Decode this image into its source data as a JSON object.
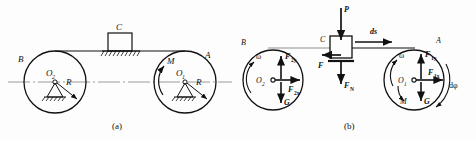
{
  "figure": {
    "caption_a": "(a)",
    "caption_b": "(b)"
  },
  "diagram_a": {
    "name": "mechanism-schematic",
    "pulley_left": {
      "center_label": "O",
      "center_sub": "2",
      "edge_label": "B",
      "radius_label": "R"
    },
    "pulley_right": {
      "center_label": "O",
      "center_sub": "1",
      "edge_label": "A",
      "radius_label": "R",
      "moment_label": "M"
    },
    "block": {
      "label": "C"
    }
  },
  "diagram_b": {
    "name": "free-body-diagram",
    "pulley_left": {
      "center_label": "O",
      "center_sub": "2",
      "edge_label": "B",
      "omega_label": "ω",
      "force_y": "F",
      "force_y_sub": "2y",
      "force_x": "F",
      "force_x_sub": "2x",
      "weight": "G"
    },
    "pulley_right": {
      "center_label": "O",
      "center_sub": "1",
      "edge_label": "A",
      "omega_label": "ω",
      "force_y": "F",
      "force_y_sub": "1y",
      "force_x": "F",
      "force_x_sub": "1x",
      "weight": "G",
      "moment_label": "M",
      "angle_label": "dφ"
    },
    "block": {
      "label": "C",
      "load": "P",
      "friction": "F",
      "normal": "F",
      "normal_sub": "N",
      "displacement": "ds"
    }
  },
  "colors": {
    "ink": "#111111",
    "axis": "#8a8a8a",
    "paper": "#fdfdfd"
  }
}
